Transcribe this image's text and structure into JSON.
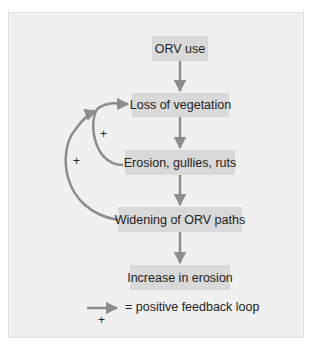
{
  "diagram": {
    "nodes": [
      {
        "id": "orv-use",
        "label": "ORV use"
      },
      {
        "id": "loss-of-vegetation",
        "label": "Loss of vegetation"
      },
      {
        "id": "erosion",
        "label": "Erosion, gullies, ruts"
      },
      {
        "id": "widening",
        "label": "Widening of ORV paths"
      },
      {
        "id": "increase",
        "label": "Increase in erosion"
      }
    ],
    "edges": [
      {
        "from": "ORV use",
        "to": "Loss of vegetation"
      },
      {
        "from": "Loss of vegetation",
        "to": "Erosion, gullies, ruts"
      },
      {
        "from": "Erosion, gullies, ruts",
        "to": "Widening of ORV paths"
      },
      {
        "from": "Widening of ORV paths",
        "to": "Increase in erosion"
      }
    ],
    "feedback_loops": [
      {
        "from": "Erosion, gullies, ruts",
        "to": "Loss of vegetation",
        "sign": "+"
      },
      {
        "from": "Widening of ORV paths",
        "to": "Loss of vegetation",
        "sign": "+"
      }
    ],
    "legend": {
      "sign": "+",
      "text": "= positive feedback loop"
    },
    "colors": {
      "panel": "#f0f0f0",
      "box": "#d9d9d9",
      "arrow": "#8c8c8c",
      "text": "#222222"
    }
  }
}
